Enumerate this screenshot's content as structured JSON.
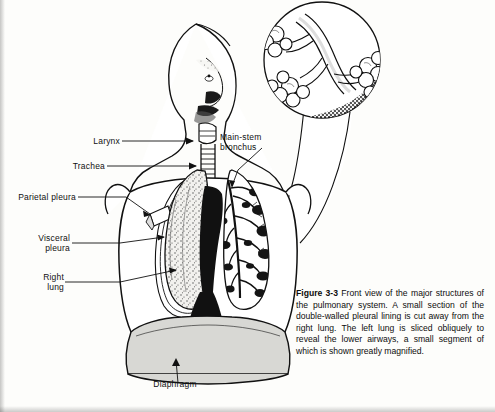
{
  "figure": {
    "number": "Figure 3-3",
    "caption_text": "Front view of the major structures of the pulmonary system. A small section of the double-walled pleural lining is cut away from the right lung. The left lung is sliced obliquely to reveal the lower airways, a small segment of which is shown greatly magnified.",
    "title_alt": "Front view of the major structures of the pulmonary system"
  },
  "labels": [
    {
      "id": "larynx",
      "text": "Larynx"
    },
    {
      "id": "trachea",
      "text": "Trachea"
    },
    {
      "id": "parietal-pleura",
      "text": "Parietal pleura"
    },
    {
      "id": "visceral-pleura",
      "text": "Visceral\npleura"
    },
    {
      "id": "right-lung",
      "text": "Right\nlung"
    },
    {
      "id": "main-stem-bronchus",
      "text": "Main-stem\nbronchus"
    },
    {
      "id": "diaphragm",
      "text": "Diaphragm"
    }
  ],
  "colors": {
    "ink": "#111111",
    "page_background": "#fdfdfb",
    "lung_fill": "#f2f1ee",
    "airway_dark": "#1a1a1a",
    "diaphragm_fill": "#d8d8d4",
    "stipple": "#3a3a3a"
  }
}
